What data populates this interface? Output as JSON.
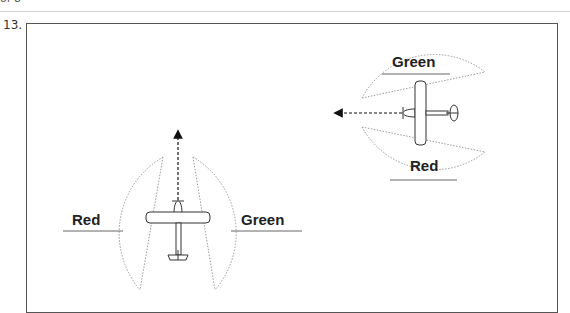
{
  "page": {
    "header_fragment": "of 8",
    "question_number": "13."
  },
  "diagram": {
    "left_aircraft": {
      "heading": "up",
      "left_label": "Red",
      "right_label": "Green"
    },
    "right_aircraft": {
      "heading": "left",
      "top_label": "Green",
      "bottom_label": "Red"
    },
    "colors": {
      "frame": "#555555",
      "arc": "#9a9a9a",
      "aircraft": "#333333",
      "text": "#222222"
    }
  }
}
